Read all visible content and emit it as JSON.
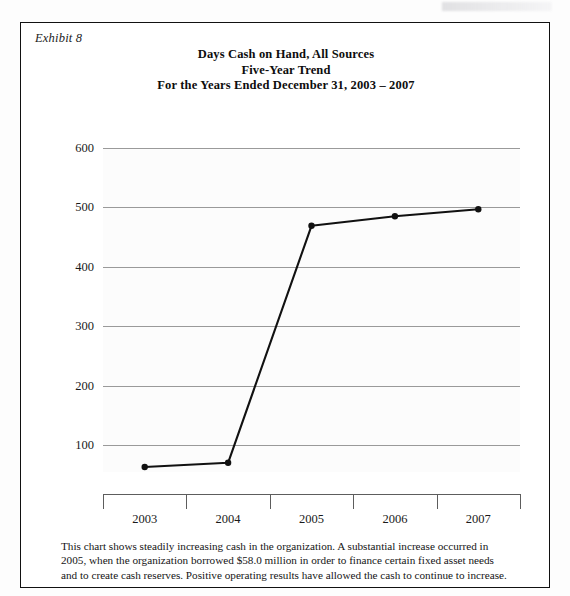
{
  "exhibit": {
    "label": "Exhibit 8"
  },
  "title": {
    "line1": "Days Cash on Hand, All Sources",
    "line2": "Five-Year Trend",
    "line3": "For the Years Ended December 31, 2003 – 2007"
  },
  "footnote": {
    "line1": "This chart shows steadily increasing cash in the organization. A substantial increase occurred in 2005,",
    "line2": "when the organization borrowed $58.0 million in order to finance certain fixed asset needs",
    "line3": "and to create cash reserves. Positive operating results have allowed the cash to continue to increase."
  },
  "colors": {
    "series": "#111111",
    "gridline": "#9a9a9a",
    "axis": "#5d5d5d",
    "frame": "#111111",
    "plot_background": "#fcfcfc"
  },
  "chart_data": {
    "type": "line",
    "xlabel": "",
    "ylabel": "",
    "categories": [
      "2003",
      "2004",
      "2005",
      "2006",
      "2007"
    ],
    "values": [
      63,
      70,
      469,
      485,
      497
    ],
    "series": [
      {
        "name": "Days Cash on Hand, All Sources",
        "values": [
          63,
          70,
          469,
          485,
          497
        ]
      }
    ],
    "ylim": [
      0,
      600
    ],
    "yticks": [
      100,
      200,
      300,
      400,
      500,
      600
    ],
    "ytick_labels": [
      "100",
      "200",
      "300",
      "400",
      "500",
      "600"
    ],
    "grid": true,
    "legend": "none",
    "markers": "filled-circle"
  }
}
